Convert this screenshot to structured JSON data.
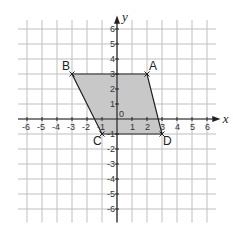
{
  "diagram": {
    "type": "coordinate-grid",
    "x_axis_label": "x",
    "y_axis_label": "y",
    "x_range": [
      -6,
      6
    ],
    "y_range": [
      -6,
      6
    ],
    "x_ticks": [
      "-6",
      "-5",
      "-4",
      "-3",
      "-2",
      "-1",
      "0",
      "1",
      "2",
      "3",
      "4",
      "5",
      "6"
    ],
    "y_ticks": [
      "-6",
      "-5",
      "-4",
      "-3",
      "-2",
      "-1",
      "1",
      "2",
      "3",
      "4",
      "5",
      "6"
    ],
    "origin_label": "0",
    "shape": {
      "name": "parallelogram ABDC",
      "fill": "#c8c8c8",
      "stroke": "#222222",
      "vertices": [
        {
          "label": "A",
          "x": 2,
          "y": 3
        },
        {
          "label": "B",
          "x": -3,
          "y": 3
        },
        {
          "label": "C",
          "x": -1,
          "y": -1
        },
        {
          "label": "D",
          "x": 3,
          "y": -1
        }
      ]
    },
    "colors": {
      "grid": "#bfbfbf",
      "axis": "#222222",
      "background": "#ffffff"
    }
  }
}
